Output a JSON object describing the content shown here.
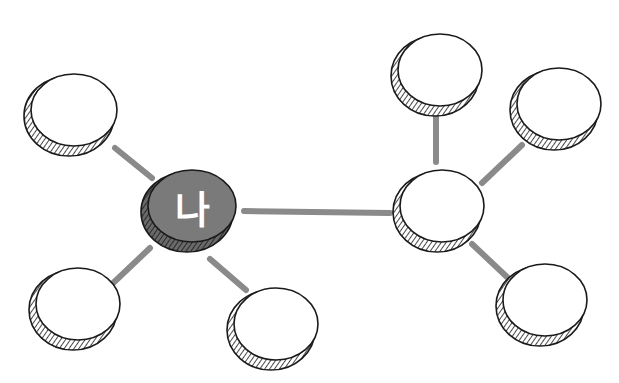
{
  "diagram": {
    "type": "mind-map",
    "colors": {
      "edge": "#8a8a8a",
      "node_fill": "#ffffff",
      "node_stroke": "#1a1a1a",
      "center_fill": "#7a7a7a",
      "center_rim": "#4a4a4a",
      "center_label": "#ffffff"
    },
    "center_node": {
      "id": "me",
      "label": "나",
      "cx": 190,
      "cy": 208,
      "rx": 46,
      "ry": 40
    },
    "hub_node": {
      "id": "hub",
      "label": "",
      "cx": 440,
      "cy": 208,
      "rx": 44,
      "ry": 40
    },
    "nodes": [
      {
        "id": "left-top",
        "label": "",
        "cx": 72,
        "cy": 112,
        "rx": 45,
        "ry": 40
      },
      {
        "id": "left-bottom",
        "label": "",
        "cx": 76,
        "cy": 306,
        "rx": 44,
        "ry": 40
      },
      {
        "id": "bottom-middle",
        "label": "",
        "cx": 274,
        "cy": 326,
        "rx": 44,
        "ry": 40
      },
      {
        "id": "top-right-1",
        "label": "",
        "cx": 438,
        "cy": 72,
        "rx": 44,
        "ry": 40
      },
      {
        "id": "top-right-2",
        "label": "",
        "cx": 557,
        "cy": 106,
        "rx": 44,
        "ry": 40
      },
      {
        "id": "bottom-right",
        "label": "",
        "cx": 543,
        "cy": 302,
        "rx": 44,
        "ry": 40
      }
    ],
    "edges": [
      {
        "from": "me",
        "to": "left-top",
        "x1": 115,
        "y1": 148,
        "x2": 152,
        "y2": 178
      },
      {
        "from": "me",
        "to": "left-bottom",
        "x1": 110,
        "y1": 286,
        "x2": 150,
        "y2": 248
      },
      {
        "from": "me",
        "to": "bottom-middle",
        "x1": 210,
        "y1": 259,
        "x2": 246,
        "y2": 290
      },
      {
        "from": "me",
        "to": "hub",
        "x1": 244,
        "y1": 211,
        "x2": 390,
        "y2": 213
      },
      {
        "from": "hub",
        "to": "top-right-1",
        "x1": 436,
        "y1": 107,
        "x2": 436,
        "y2": 162
      },
      {
        "from": "hub",
        "to": "top-right-2",
        "x1": 482,
        "y1": 183,
        "x2": 522,
        "y2": 145
      },
      {
        "from": "hub",
        "to": "bottom-right",
        "x1": 472,
        "y1": 244,
        "x2": 507,
        "y2": 277
      }
    ]
  }
}
